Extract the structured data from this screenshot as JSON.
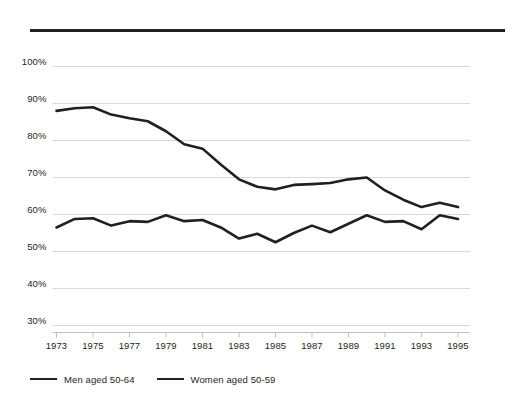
{
  "chart_data": {
    "type": "line",
    "title": "",
    "xlabel": "",
    "ylabel": "",
    "grid": true,
    "legend_position": "bottom-left",
    "x": [
      1973,
      1974,
      1975,
      1976,
      1977,
      1978,
      1979,
      1980,
      1981,
      1982,
      1983,
      1984,
      1985,
      1986,
      1987,
      1988,
      1989,
      1990,
      1991,
      1992,
      1993,
      1994,
      1995
    ],
    "xlim": [
      1973,
      1995
    ],
    "ylim": [
      30,
      100
    ],
    "ytick_labels": [
      "100%",
      "90%",
      "80%",
      "70%",
      "60%",
      "50%",
      "40%",
      "30%"
    ],
    "ytick_values": [
      100,
      90,
      80,
      70,
      60,
      50,
      40,
      30
    ],
    "xtick_labels": [
      "1973",
      "1975",
      "1977",
      "1979",
      "1981",
      "1983",
      "1985",
      "1987",
      "1989",
      "1991",
      "1993",
      "1995"
    ],
    "xtick_values": [
      1973,
      1975,
      1977,
      1979,
      1981,
      1983,
      1985,
      1987,
      1989,
      1991,
      1993,
      1995
    ],
    "series": [
      {
        "name": "Men aged 50-64",
        "color": "#231f20",
        "values": [
          88.0,
          88.7,
          89.0,
          87.0,
          86.0,
          85.2,
          82.5,
          79.0,
          77.8,
          73.5,
          69.5,
          67.5,
          66.8,
          68.0,
          68.2,
          68.5,
          69.5,
          70.0,
          66.5,
          64.0,
          62.0,
          63.2,
          62.0
        ]
      },
      {
        "name": "Women aged 50-59",
        "color": "#231f20",
        "values": [
          56.5,
          58.8,
          59.0,
          57.0,
          58.2,
          58.0,
          59.8,
          58.2,
          58.5,
          56.5,
          53.5,
          54.8,
          52.5,
          55.0,
          57.0,
          55.2,
          57.5,
          59.8,
          58.0,
          58.2,
          56.0,
          59.8,
          58.8
        ]
      }
    ]
  },
  "legend": {
    "items": [
      {
        "label": "Men aged 50-64"
      },
      {
        "label": "Women aged 50-59"
      }
    ]
  }
}
